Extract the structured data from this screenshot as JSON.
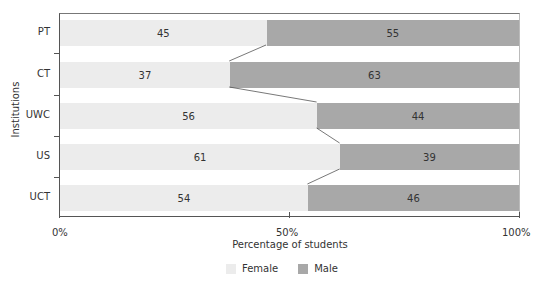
{
  "chart_data": {
    "type": "bar",
    "orientation": "horizontal",
    "stacked": true,
    "percent_stacked": true,
    "title": "",
    "xlabel": "Percentage of students",
    "ylabel": "Institutions",
    "xlim": [
      0,
      100
    ],
    "x_ticks": [
      "0%",
      "50%",
      "100%"
    ],
    "categories": [
      "PT",
      "CT",
      "UWC",
      "US",
      "UCT"
    ],
    "series": [
      {
        "name": "Female",
        "color": "#ececec",
        "values": [
          45,
          37,
          56,
          61,
          54
        ]
      },
      {
        "name": "Male",
        "color": "#a8a8a8",
        "values": [
          55,
          63,
          44,
          39,
          46
        ]
      }
    ],
    "data_labels": true,
    "series_lines": true,
    "grid": false,
    "legend_position": "bottom"
  },
  "axes": {
    "x_title": "Percentage of students",
    "y_title": "Institutions",
    "x_tick_0": "0%",
    "x_tick_50": "50%",
    "x_tick_100": "100%"
  },
  "legend": {
    "female_label": "Female",
    "male_label": "Male",
    "female_color": "#ececec",
    "male_color": "#a8a8a8"
  }
}
